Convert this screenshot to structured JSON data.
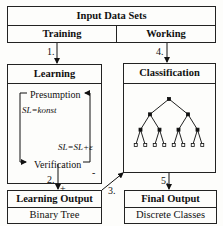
{
  "input": {
    "title": "Input Data Sets",
    "left": "Training",
    "right": "Working"
  },
  "steps": {
    "s1": "1.",
    "s2": "2.",
    "s3": "3.",
    "s4": "4.",
    "s5": "5."
  },
  "learning": {
    "title": "Learning",
    "presumption": "Presumption",
    "formula1": "SL=konst",
    "formula2": "SL=SL+ε",
    "verification": "Verification",
    "plus": "+",
    "minus": "-"
  },
  "classification": {
    "title": "Classification",
    "tree_levels": 4,
    "leaf_count": 8
  },
  "learning_output": {
    "title": "Learning Output",
    "subtitle": "Binary Tree"
  },
  "final_output": {
    "title": "Final Output",
    "subtitle": "Discrete Classes"
  }
}
